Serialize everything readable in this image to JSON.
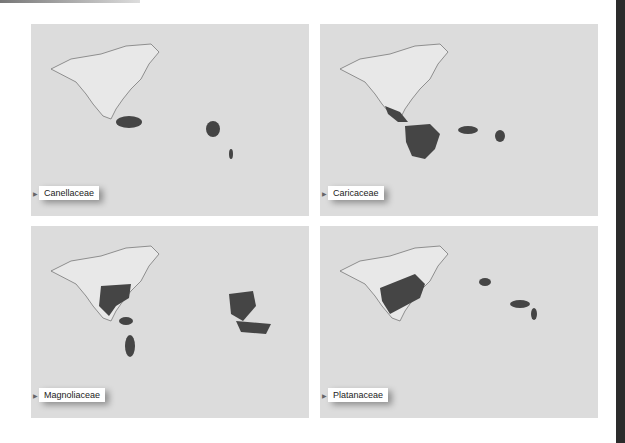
{
  "figure": {
    "panels": [
      {
        "family": "Canellaceae",
        "regions": [
          "northern South America",
          "East Africa",
          "Madagascar"
        ]
      },
      {
        "family": "Caricaceae",
        "regions": [
          "Central America",
          "tropical South America",
          "West Africa",
          "East Africa"
        ]
      },
      {
        "family": "Magnoliaceae",
        "regions": [
          "eastern North America",
          "Mexico & Central America",
          "northern South America",
          "southeastern South America",
          "Southeast Asia",
          "Malesia"
        ]
      },
      {
        "family": "Platanaceae",
        "regions": [
          "North America",
          "southeastern Europe",
          "southern Asia",
          "Indochina"
        ]
      }
    ],
    "colors": {
      "land": "#e6e6e6",
      "ocean": "#d6d6d6",
      "range": "#4a4a4a",
      "coast": "#666666"
    }
  }
}
